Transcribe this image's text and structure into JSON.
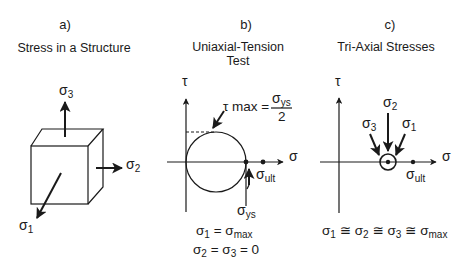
{
  "panels": [
    {
      "id": "a",
      "label": "a)",
      "title": "Stress in a Structure",
      "stresses": [
        {
          "symbol": "σ",
          "subscript": "3",
          "direction": "up"
        },
        {
          "symbol": "σ",
          "subscript": "2",
          "direction": "right"
        },
        {
          "symbol": "σ",
          "subscript": "1",
          "direction": "down-left"
        }
      ]
    },
    {
      "id": "b",
      "label": "b)",
      "title_line1": "Uniaxial-Tension",
      "title_line2": "Test",
      "axes": {
        "vertical": "τ",
        "horizontal": "σ"
      },
      "tau_max_annotation": {
        "lhs": "τ max =",
        "numerator_symbol": "σ",
        "numerator_subscript": "ys",
        "denominator": "2"
      },
      "points": [
        {
          "symbol": "σ",
          "subscript": "ys"
        },
        {
          "symbol": "σ",
          "subscript": "ult"
        }
      ],
      "equations": [
        {
          "parts": [
            "σ",
            "1",
            " = σ",
            "max"
          ]
        },
        {
          "parts": [
            "σ",
            "2",
            " = σ",
            "3",
            " = 0"
          ]
        }
      ]
    },
    {
      "id": "c",
      "label": "c)",
      "title": "Tri-Axial Stresses",
      "axes": {
        "vertical": "τ",
        "horizontal": "σ"
      },
      "arrow_labels": [
        {
          "symbol": "σ",
          "subscript": "3"
        },
        {
          "symbol": "σ",
          "subscript": "2"
        },
        {
          "symbol": "σ",
          "subscript": "1"
        }
      ],
      "ult_label": {
        "symbol": "σ",
        "subscript": "ult"
      },
      "equation": {
        "parts": [
          "σ",
          "1",
          " ≅ σ",
          "2",
          " ≅ σ",
          "3",
          " ≅ σ",
          "max"
        ]
      }
    }
  ]
}
